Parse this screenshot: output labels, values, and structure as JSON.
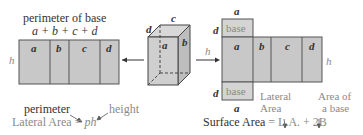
{
  "left_net": {
    "title": "perimeter of base",
    "formula": "a + b + c + d",
    "faces": [
      "a",
      "b",
      "c",
      "d"
    ],
    "height_label": "h"
  },
  "left_formula": {
    "perimeter_label": "perimeter",
    "height_label": "height",
    "lateral_area_text": "Lateral Area = ",
    "lateral_area_var": "ph"
  },
  "prism": {
    "labels": {
      "top_c": "c",
      "top_d": "d",
      "face_a": "a",
      "face_b": "b",
      "left_d": "d"
    }
  },
  "right_net": {
    "top_label_a": "a",
    "base_top": "base",
    "base_bottom": "base",
    "faces": [
      "a",
      "b",
      "c",
      "d"
    ],
    "left_d_top": "d",
    "left_d_bottom": "d",
    "bottom_label_a": "a",
    "height_label_left": "h",
    "height_label_right": "h"
  },
  "right_formula": {
    "lateral_area_note": [
      "Lateral",
      "Area"
    ],
    "base_area_note": [
      "Area of",
      "a base"
    ],
    "surface_area_label": "Surface Area",
    "equals": " = ",
    "expression": "L.A. + 2B"
  },
  "colors": {
    "face_fill": "#c8c8c8",
    "face_stroke": "#555555",
    "text_dark": "#333333",
    "text_grey": "#8a8a8a"
  }
}
